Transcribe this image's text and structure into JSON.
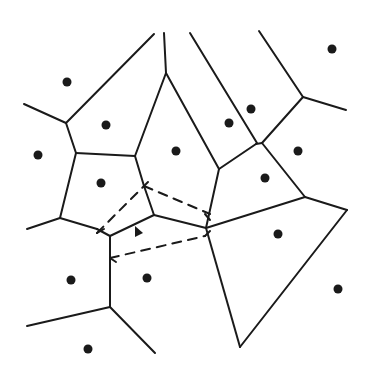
{
  "diagram": {
    "type": "voronoi",
    "colors": {
      "background": "#ffffff",
      "ink": "#1a1a1a"
    },
    "sites": [
      {
        "x": 67,
        "y": 82
      },
      {
        "x": 106,
        "y": 125
      },
      {
        "x": 38,
        "y": 155
      },
      {
        "x": 176,
        "y": 151
      },
      {
        "x": 101,
        "y": 183
      },
      {
        "x": 229,
        "y": 123
      },
      {
        "x": 251,
        "y": 109
      },
      {
        "x": 332,
        "y": 49
      },
      {
        "x": 298,
        "y": 151
      },
      {
        "x": 265,
        "y": 178
      },
      {
        "x": 278,
        "y": 234
      },
      {
        "x": 338,
        "y": 289
      },
      {
        "x": 71,
        "y": 280
      },
      {
        "x": 147,
        "y": 278
      },
      {
        "x": 88,
        "y": 349
      }
    ],
    "edges": [
      [
        24,
        104,
        66,
        123
      ],
      [
        66,
        123,
        154,
        34
      ],
      [
        66,
        123,
        76,
        153
      ],
      [
        76,
        153,
        135,
        156
      ],
      [
        135,
        156,
        166,
        73
      ],
      [
        166,
        73,
        164,
        33
      ],
      [
        166,
        73,
        219,
        169
      ],
      [
        76,
        153,
        60,
        218
      ],
      [
        60,
        218,
        27,
        229
      ],
      [
        60,
        218,
        97,
        229
      ],
      [
        97,
        229,
        110,
        236
      ],
      [
        110,
        236,
        154,
        215
      ],
      [
        154,
        215,
        206,
        228
      ],
      [
        135,
        156,
        144,
        186
      ],
      [
        144,
        186,
        154,
        215
      ],
      [
        206,
        228,
        219,
        169
      ],
      [
        219,
        169,
        256,
        144
      ],
      [
        256,
        144,
        262,
        143
      ],
      [
        190,
        33,
        257,
        143
      ],
      [
        262,
        143,
        303,
        97
      ],
      [
        303,
        97,
        259,
        31
      ],
      [
        303,
        97,
        346,
        110
      ],
      [
        262,
        143,
        305,
        197
      ],
      [
        206,
        228,
        305,
        197
      ],
      [
        305,
        197,
        347,
        210
      ],
      [
        347,
        210,
        240,
        347
      ],
      [
        206,
        228,
        240,
        347
      ],
      [
        110,
        236,
        110,
        307
      ],
      [
        110,
        307,
        27,
        326
      ],
      [
        110,
        307,
        155,
        353
      ]
    ],
    "dashed_edges": [
      [
        97,
        233,
        144,
        186
      ],
      [
        144,
        186,
        210,
        214
      ],
      [
        110,
        258,
        205,
        236
      ]
    ],
    "ticks": [
      [
        97,
        233,
        104,
        229
      ],
      [
        144,
        186,
        148,
        182
      ],
      [
        205,
        214,
        210,
        220
      ],
      [
        110,
        258,
        116,
        262
      ],
      [
        205,
        236,
        210,
        231
      ]
    ],
    "marker": {
      "shape": "triangle",
      "x": 138,
      "y": 232
    }
  }
}
